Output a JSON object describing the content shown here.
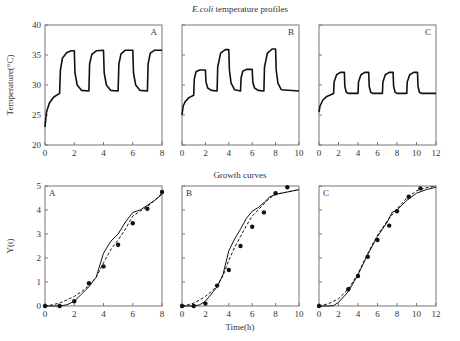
{
  "chart_data": [
    {
      "type": "line",
      "group": "temperature",
      "panel": "A",
      "title": "E.coli temperature profiles",
      "xlabel": "",
      "ylabel": "Temperature(°C)",
      "xlim": [
        0,
        8
      ],
      "ylim": [
        20,
        40
      ],
      "xticks": [
        0,
        2,
        4,
        6,
        8
      ],
      "yticks": [
        20,
        25,
        30,
        35,
        40
      ],
      "series": [
        {
          "name": "temperature",
          "x": [
            0,
            0.1,
            0.3,
            0.6,
            1.0,
            1.05,
            1.2,
            1.5,
            1.8,
            2.0,
            2.05,
            2.2,
            2.5,
            3.0,
            3.05,
            3.2,
            3.5,
            4.0,
            4.05,
            4.2,
            4.5,
            5.0,
            5.05,
            5.2,
            5.5,
            6.0,
            6.05,
            6.2,
            6.5,
            7.0,
            7.05,
            7.2,
            7.5,
            8.0
          ],
          "y": [
            23,
            25.5,
            27,
            28,
            28.6,
            32.5,
            34.5,
            35.4,
            35.7,
            35.7,
            32,
            30,
            29.1,
            29,
            33.5,
            35.1,
            35.7,
            35.8,
            32,
            30,
            29.1,
            29,
            33.5,
            35.2,
            35.8,
            35.8,
            32,
            30,
            29.1,
            29,
            33.5,
            35.3,
            35.8,
            35.8
          ]
        }
      ]
    },
    {
      "type": "line",
      "group": "temperature",
      "panel": "B",
      "xlim": [
        0,
        10
      ],
      "ylim": [
        20,
        40
      ],
      "xticks": [
        0,
        2,
        4,
        6,
        8,
        10
      ],
      "series": [
        {
          "name": "temperature",
          "x": [
            0,
            0.1,
            0.3,
            0.6,
            1.0,
            1.05,
            1.2,
            1.5,
            2.0,
            2.05,
            2.2,
            2.5,
            3.0,
            3.05,
            3.3,
            3.7,
            4.0,
            4.05,
            4.2,
            4.5,
            5.0,
            5.05,
            5.2,
            5.5,
            6.0,
            6.05,
            6.2,
            6.5,
            7.0,
            7.05,
            7.3,
            7.7,
            8.0,
            8.05,
            8.2,
            8.5,
            10.0
          ],
          "y": [
            25,
            26.5,
            27.3,
            27.9,
            28.3,
            31,
            32.2,
            32.5,
            32.5,
            30.5,
            29.5,
            29.1,
            29,
            33,
            35.3,
            35.9,
            35.9,
            32.5,
            30.3,
            29.2,
            29,
            31.2,
            32.3,
            32.6,
            32.6,
            30.5,
            29.5,
            29.1,
            29,
            33,
            35.3,
            36,
            36,
            32.5,
            30.3,
            29.2,
            29
          ]
        }
      ]
    },
    {
      "type": "line",
      "group": "temperature",
      "panel": "C",
      "xlim": [
        0,
        12
      ],
      "ylim": [
        20,
        40
      ],
      "xticks": [
        0,
        2,
        4,
        6,
        8,
        10,
        12
      ],
      "series": [
        {
          "name": "temperature",
          "x": [
            0,
            0.1,
            0.4,
            0.8,
            1.5,
            1.55,
            1.8,
            2.2,
            2.6,
            2.65,
            2.8,
            3.0,
            4.0,
            4.05,
            4.3,
            4.7,
            5.1,
            5.15,
            5.3,
            5.5,
            6.5,
            6.55,
            6.8,
            7.2,
            7.6,
            7.65,
            7.8,
            8.0,
            9.0,
            9.05,
            9.3,
            9.7,
            10.1,
            10.15,
            10.3,
            10.5,
            12.0
          ],
          "y": [
            25.5,
            26.5,
            27.5,
            28.1,
            28.6,
            30.5,
            31.7,
            32.1,
            32.1,
            29.8,
            28.8,
            28.6,
            28.6,
            30.5,
            31.7,
            32.1,
            32.1,
            29.8,
            28.8,
            28.6,
            28.6,
            30.5,
            31.7,
            32.1,
            32.1,
            29.8,
            28.8,
            28.6,
            28.6,
            30.5,
            31.7,
            32.1,
            32.1,
            29.8,
            28.8,
            28.6,
            28.6
          ]
        }
      ]
    },
    {
      "type": "line",
      "group": "growth",
      "panel": "A",
      "title": "Growth curves",
      "xlabel": "",
      "ylabel": "Y(t)",
      "xlim": [
        0,
        8
      ],
      "ylim": [
        0,
        5
      ],
      "xticks": [
        0,
        2,
        4,
        6,
        8
      ],
      "yticks": [
        0,
        1,
        2,
        3,
        4,
        5
      ],
      "series": [
        {
          "name": "model (solid)",
          "style": "solid",
          "x": [
            0,
            1,
            1.5,
            2,
            2.5,
            3,
            3.5,
            4,
            4.5,
            5,
            5.5,
            6,
            6.5,
            7,
            7.5,
            8
          ],
          "y": [
            0,
            0,
            0.05,
            0.2,
            0.5,
            0.8,
            1.2,
            2.2,
            2.7,
            3.0,
            3.5,
            3.9,
            4.0,
            4.2,
            4.4,
            4.65
          ]
        },
        {
          "name": "model (dashed)",
          "style": "dashed",
          "x": [
            0,
            0.5,
            1,
            1.5,
            2,
            2.5,
            3,
            3.5,
            4,
            4.5,
            5,
            5.5,
            6,
            6.5,
            7,
            7.5,
            8
          ],
          "y": [
            0,
            0.05,
            0.12,
            0.25,
            0.4,
            0.6,
            0.85,
            1.2,
            1.8,
            2.35,
            2.75,
            3.2,
            3.75,
            3.95,
            4.15,
            4.4,
            4.7
          ]
        },
        {
          "name": "experimental",
          "style": "points",
          "x": [
            0,
            1,
            2,
            3,
            4,
            5,
            6,
            7,
            8
          ],
          "y": [
            0,
            0,
            0.2,
            0.95,
            1.65,
            2.55,
            3.45,
            4.05,
            4.75
          ]
        }
      ]
    },
    {
      "type": "line",
      "group": "growth",
      "panel": "B",
      "xlabel": "Time(h)",
      "xlim": [
        0,
        10
      ],
      "ylim": [
        0,
        5
      ],
      "xticks": [
        0,
        2,
        4,
        6,
        8,
        10
      ],
      "series": [
        {
          "name": "model (solid)",
          "style": "solid",
          "x": [
            0,
            1,
            1.5,
            2,
            2.5,
            3,
            3.5,
            4,
            4.5,
            5,
            5.5,
            6,
            6.5,
            7,
            7.5,
            8,
            9,
            10
          ],
          "y": [
            0,
            0,
            0.05,
            0.2,
            0.5,
            0.8,
            1.3,
            2.3,
            2.8,
            3.2,
            3.65,
            3.95,
            4.1,
            4.3,
            4.55,
            4.65,
            4.75,
            4.85
          ]
        },
        {
          "name": "model (dashed)",
          "style": "dashed",
          "x": [
            0,
            0.5,
            1,
            1.5,
            2,
            2.5,
            3,
            3.5,
            4,
            4.5,
            5,
            5.5,
            6,
            6.5,
            7,
            7.5,
            8,
            9,
            10
          ],
          "y": [
            0,
            0.05,
            0.12,
            0.25,
            0.4,
            0.6,
            0.85,
            1.25,
            1.9,
            2.45,
            2.9,
            3.35,
            3.75,
            4.0,
            4.25,
            4.5,
            4.65,
            4.75,
            4.85
          ]
        },
        {
          "name": "experimental",
          "style": "points",
          "x": [
            0,
            1,
            2,
            3,
            4,
            5,
            6,
            7,
            8,
            9
          ],
          "y": [
            0,
            0,
            0.1,
            0.85,
            1.5,
            2.5,
            3.3,
            3.9,
            4.7,
            4.95
          ]
        }
      ]
    },
    {
      "type": "line",
      "group": "growth",
      "panel": "C",
      "xlim": [
        0,
        12
      ],
      "ylim": [
        0,
        5
      ],
      "xticks": [
        0,
        2,
        4,
        6,
        8,
        10,
        12
      ],
      "series": [
        {
          "name": "model (solid)",
          "style": "solid",
          "x": [
            0,
            1,
            1.5,
            2,
            3,
            4,
            5,
            6,
            7,
            7.5,
            8,
            9,
            10,
            11,
            12
          ],
          "y": [
            0,
            0,
            0.02,
            0.15,
            0.6,
            1.3,
            2.15,
            2.9,
            3.5,
            3.9,
            4.0,
            4.4,
            4.7,
            4.85,
            4.95
          ]
        },
        {
          "name": "model (dashed)",
          "style": "dashed",
          "x": [
            0,
            1,
            2,
            3,
            4,
            5,
            6,
            7,
            8,
            9,
            10,
            11,
            12
          ],
          "y": [
            0,
            0.1,
            0.3,
            0.7,
            1.35,
            2.2,
            2.95,
            3.55,
            4.05,
            4.5,
            4.8,
            4.93,
            5.0
          ]
        },
        {
          "name": "experimental",
          "style": "points",
          "x": [
            0,
            3,
            4,
            5,
            6,
            7.2,
            8,
            9.2,
            10.4
          ],
          "y": [
            0,
            0.7,
            1.25,
            2.05,
            2.75,
            3.35,
            3.95,
            4.55,
            4.9
          ]
        }
      ]
    }
  ],
  "figure": {
    "top_title": "E.coli temperature profiles",
    "top_title_italic": "E.coli",
    "top_title_rest": " temperature profiles",
    "bottom_title": "Growth curves",
    "top_ylabel": "Temperature(°C)",
    "bottom_ylabel": "Y(t)",
    "bottom_xlabel": "Time(h)",
    "panel_letters": [
      "A",
      "B",
      "C"
    ]
  }
}
